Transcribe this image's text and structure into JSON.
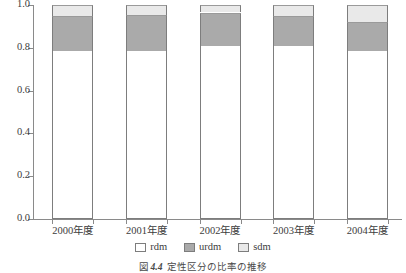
{
  "chart_data": {
    "type": "bar",
    "title": "",
    "subtitle": "",
    "xlabel": "",
    "ylabel": "",
    "ylim": [
      0.0,
      1.0
    ],
    "grid": false,
    "stacked": true,
    "legend_position": "bottom",
    "categories": [
      "2000年度",
      "2001年度",
      "2002年度",
      "2003年度",
      "2004年度"
    ],
    "ytick_labels": [
      "1.0",
      "0.8",
      "0.6",
      "0.4",
      "0.2",
      "0.0"
    ],
    "ytick_values": [
      1.0,
      0.8,
      0.6,
      0.4,
      0.2,
      0.0
    ],
    "series": [
      {
        "name": "rdm",
        "color": "#ffffff",
        "values": [
          0.785,
          0.785,
          0.81,
          0.81,
          0.785
        ]
      },
      {
        "name": "urdm",
        "color": "#aaaaaa",
        "values": [
          0.165,
          0.17,
          0.155,
          0.14,
          0.135
        ]
      },
      {
        "name": "sdm",
        "color": "#e9e9e9",
        "values": [
          0.05,
          0.045,
          0.035,
          0.05,
          0.08
        ]
      }
    ]
  },
  "legend": {
    "items": [
      {
        "label": "rdm",
        "color": "#ffffff"
      },
      {
        "label": "urdm",
        "color": "#aaaaaa"
      },
      {
        "label": "sdm",
        "color": "#e9e9e9"
      }
    ]
  },
  "caption": {
    "prefix": "図",
    "number": "4.4",
    "text": "定性区分の比率の推移"
  },
  "colors": {
    "axis": "#8a8a8a",
    "bar_outline": "#7d7d7d",
    "text": "#3d3d3d",
    "background": "#ffffff"
  }
}
